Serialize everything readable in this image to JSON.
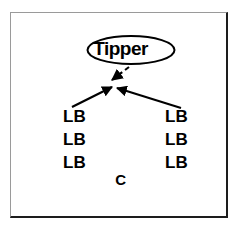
{
  "figure": {
    "background_color": "#ffffff",
    "frame": {
      "name": "outer-border",
      "light_edge_color": "#9a9a9a",
      "dark_edge_color": "#1d1d1d"
    },
    "root_node": {
      "label": "Tipper",
      "shape": "ellipse",
      "stroke_color": "#000000",
      "fill_color": "#ffffff"
    },
    "edges": [
      {
        "name": "dashed-edge-from-tipper",
        "style": "dashed",
        "direction": "down-left",
        "color": "#000000",
        "arrowhead": "filled-triangle"
      },
      {
        "name": "solid-edge-from-left-group",
        "style": "solid",
        "direction": "up-right",
        "color": "#000000",
        "arrowhead": "filled-triangle"
      },
      {
        "name": "solid-edge-from-right-group",
        "style": "solid",
        "direction": "up-left",
        "color": "#000000",
        "arrowhead": "filled-triangle"
      }
    ],
    "left_group": {
      "name": "left-lb-column",
      "items": [
        "LB",
        "LB",
        "LB"
      ]
    },
    "right_group": {
      "name": "right-lb-column",
      "items": [
        "LB",
        "LB",
        "LB"
      ]
    },
    "bottom_label": "C"
  }
}
